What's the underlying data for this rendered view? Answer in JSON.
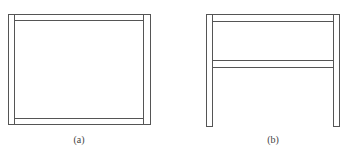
{
  "figure": {
    "panels": [
      {
        "id": "a",
        "caption": "(a)",
        "description": "Rectangular frame with two vertical posts and top and bottom horizontal rails",
        "parts": [
          "left-post",
          "right-post",
          "top-rail",
          "bottom-rail"
        ]
      },
      {
        "id": "b",
        "caption": "(b)",
        "description": "Frame with two vertical posts, a top rail and a middle rail; open at bottom",
        "parts": [
          "left-post",
          "right-post",
          "top-rail",
          "middle-rail"
        ]
      }
    ],
    "colors": {
      "stroke": "#555555",
      "fill": "#ffffff",
      "background": "#ffffff"
    }
  }
}
